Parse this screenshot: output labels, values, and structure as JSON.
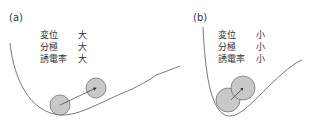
{
  "panels": [
    {
      "label": "(a)",
      "properties": [
        {
          "name": "変位",
          "value": "大"
        },
        {
          "name": "分極",
          "value": "大"
        },
        {
          "name": "誘電率",
          "value": "大"
        }
      ],
      "description": "Shallow potential well; ion displaced far from equilibrium"
    },
    {
      "label": "(b)",
      "properties": [
        {
          "name": "変位",
          "value": "小"
        },
        {
          "name": "分極",
          "value": "小"
        },
        {
          "name": "誘電率",
          "value": "小"
        }
      ],
      "description": "Steep potential well; ion displaced slightly from equilibrium"
    }
  ],
  "colors": {
    "curve": "#555555",
    "ball_fill": "#c8c8c8",
    "ball_stroke": "#666666",
    "arrow": "#333333"
  }
}
